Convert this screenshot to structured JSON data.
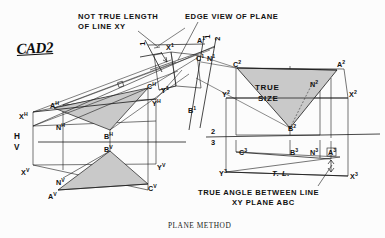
{
  "drawing": {
    "title_caption": "PLANE METHOD",
    "logo": "CAD2",
    "colors": {
      "ink": "#111111",
      "paper": "#fcfcfc",
      "fill_gray": "#c9c9c9",
      "fill_gray_dark": "#b9b9b9",
      "thin_line": "#3a3a3a"
    }
  },
  "annotations": {
    "not_true_length_l1": "NOT TRUE LENGTH",
    "not_true_length_l2": "OF LINE  XY",
    "edge_view": "EDGE VIEW OF PLANE",
    "true_size_l1": "TRUE",
    "true_size_l2": "SIZE",
    "true_angle_l1": "TRUE ANGLE BETWEEN  LINE",
    "true_angle_l2": "XY PLANE  ABC",
    "true_length_mark": "T. L."
  },
  "fold_lines": {
    "hv_top": "H",
    "hv_bottom": "V",
    "f12_top": "1",
    "f12_bottom": "2",
    "f23_top": "2",
    "f23_bottom": "3",
    "f1_left_top": "1",
    "f1_left_bottom": "2"
  },
  "points": {
    "h_view": [
      {
        "base": "X",
        "sup": "H"
      },
      {
        "base": "A",
        "sup": "H"
      },
      {
        "base": "C",
        "sup": "H"
      },
      {
        "base": "N",
        "sup": "H"
      },
      {
        "base": "B",
        "sup": "H"
      },
      {
        "base": "Y",
        "sup": "H"
      }
    ],
    "v_view": [
      {
        "base": "X",
        "sup": "V"
      },
      {
        "base": "A",
        "sup": "V"
      },
      {
        "base": "N",
        "sup": "V"
      },
      {
        "base": "B",
        "sup": "V"
      },
      {
        "base": "C",
        "sup": "V"
      },
      {
        "base": "Y",
        "sup": "V"
      }
    ],
    "view1": [
      {
        "base": "X",
        "sup": "1"
      },
      {
        "base": "A",
        "sup": "1"
      },
      {
        "base": "C",
        "sup": "1"
      },
      {
        "base": "N",
        "sup": "1"
      },
      {
        "base": "Y",
        "sup": "1"
      },
      {
        "base": "B",
        "sup": "1"
      }
    ],
    "view2": [
      {
        "base": "C",
        "sup": "2"
      },
      {
        "base": "A",
        "sup": "2"
      },
      {
        "base": "N",
        "sup": "2"
      },
      {
        "base": "B",
        "sup": "2"
      },
      {
        "base": "Y",
        "sup": "2"
      },
      {
        "base": "X",
        "sup": "2"
      }
    ],
    "view3": [
      {
        "base": "C",
        "sup": "3"
      },
      {
        "base": "B",
        "sup": "3"
      },
      {
        "base": "N",
        "sup": "3"
      },
      {
        "base": "A",
        "sup": "3"
      },
      {
        "base": "Y",
        "sup": "3"
      },
      {
        "base": "X",
        "sup": "3"
      }
    ]
  }
}
